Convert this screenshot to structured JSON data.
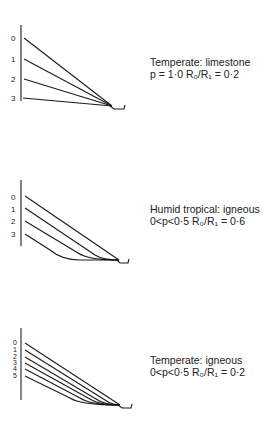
{
  "panels": [
    {
      "title": "Temperate: limestone",
      "params": "p = 1·0    R₀/R₁ = 0·2",
      "curve_labels": [
        "0",
        "1",
        "2",
        "3"
      ],
      "curve_shape": "straight lines converging at channel"
    },
    {
      "title": "Humid tropical: igneous",
      "params": "0<p<0·5    R₀/R₁ = 0·6",
      "curve_labels": [
        "0",
        "1",
        "2",
        "3"
      ],
      "curve_shape": "straight slopes flattening into a basal plain"
    },
    {
      "title": "Temperate: igneous",
      "params": "0<p<0·5    R₀/R₁ = 0·2",
      "curve_labels": [
        "0",
        "1",
        "2",
        "3",
        "4",
        "5"
      ],
      "curve_shape": "parallel retreating slopes converging at channel"
    }
  ],
  "colors": {
    "line": "#1a1a1a",
    "background": "#ffffff"
  }
}
